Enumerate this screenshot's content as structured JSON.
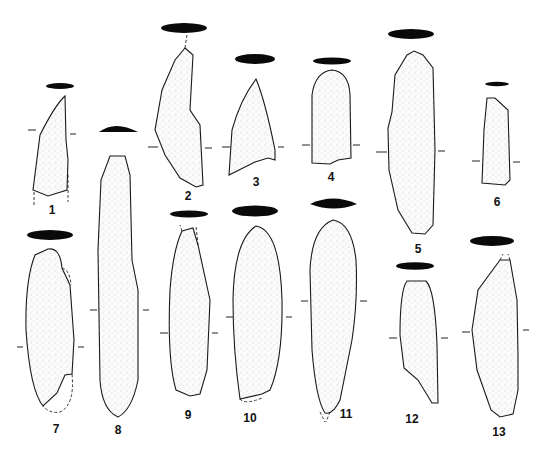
{
  "figure": {
    "type": "archaeological artifact plate",
    "artifacts": [
      {
        "id": "1",
        "label": "1"
      },
      {
        "id": "2",
        "label": "2"
      },
      {
        "id": "3",
        "label": "3"
      },
      {
        "id": "4",
        "label": "4"
      },
      {
        "id": "5",
        "label": "5"
      },
      {
        "id": "6",
        "label": "6"
      },
      {
        "id": "7",
        "label": "7"
      },
      {
        "id": "8",
        "label": "8"
      },
      {
        "id": "9",
        "label": "9"
      },
      {
        "id": "10",
        "label": "10"
      },
      {
        "id": "11",
        "label": "11"
      },
      {
        "id": "12",
        "label": "12"
      },
      {
        "id": "13",
        "label": "13"
      }
    ],
    "colors": {
      "background": "#ffffff",
      "ink": "#0a0a0a",
      "stipple": "#9a9a9a"
    }
  }
}
